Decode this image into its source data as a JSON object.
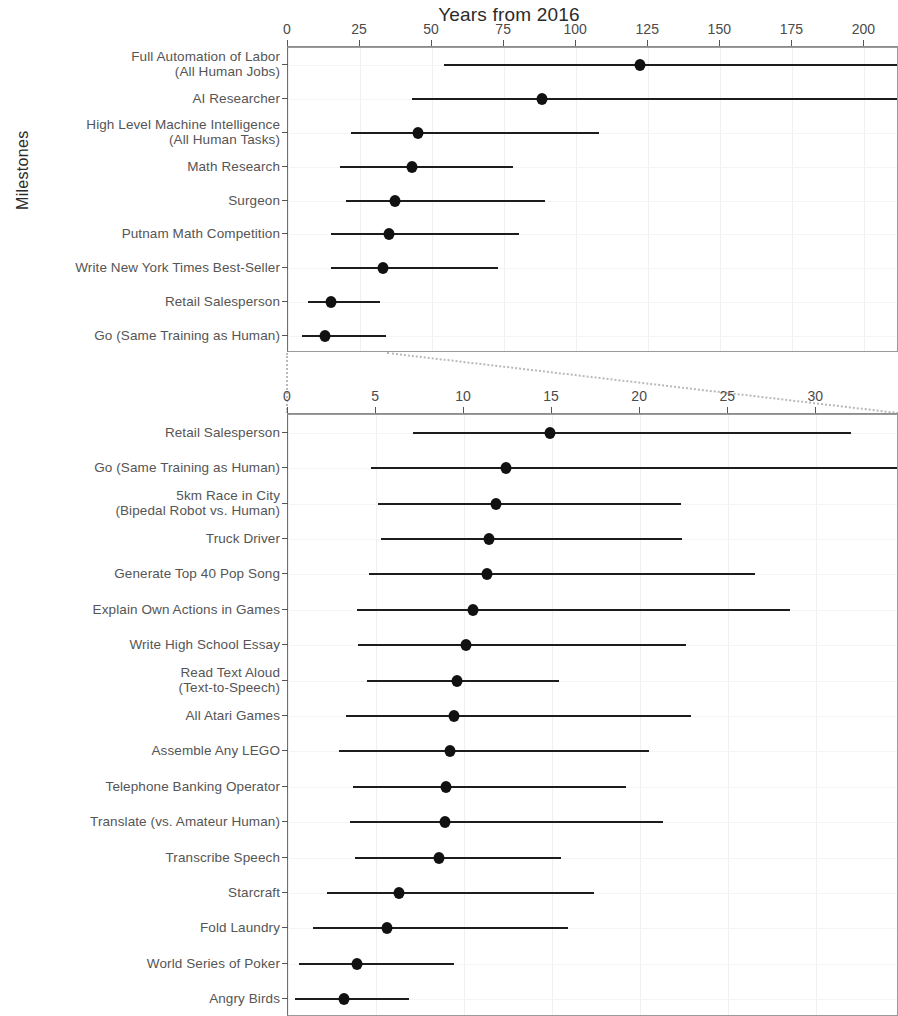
{
  "figure": {
    "x_axis_title": "Years from 2016",
    "y_axis_title": "Milestones"
  },
  "chart_data": [
    {
      "type": "scatter",
      "id": "top-panel",
      "title": "Years from 2016",
      "xlabel": "Years from 2016",
      "ylabel": "Milestones",
      "xlim": [
        0,
        212
      ],
      "grid": true,
      "legend": "none",
      "orientation": "horizontal",
      "marker": "filled-circle-with-range-bar",
      "xticks": [
        0,
        25,
        50,
        75,
        100,
        125,
        150,
        175,
        200
      ],
      "xtick_labels": [
        "0",
        "25",
        "50",
        "75",
        "100",
        "125",
        "150",
        "175",
        "200"
      ],
      "categories": [
        "Full Automation of Labor\n(All Human Jobs)",
        "AI Researcher",
        "High Level Machine Intelligence\n(All Human Tasks)",
        "Math Research",
        "Surgeon",
        "Putnam Math Competition",
        "Write New York Times Best-Seller",
        "Retail Salesperson",
        "Go (Same Training as Human)"
      ],
      "values": [
        122,
        88,
        45,
        43,
        37,
        35,
        33,
        15,
        13
      ],
      "low": [
        54,
        43,
        22,
        18,
        20,
        15,
        15,
        7,
        5
      ],
      "high": [
        212,
        212,
        108,
        78,
        89,
        80,
        73,
        32,
        34
      ],
      "high_clipped": [
        true,
        true,
        false,
        false,
        false,
        false,
        false,
        false,
        false
      ]
    },
    {
      "type": "scatter",
      "id": "bottom-panel",
      "title": "",
      "xlabel": "",
      "ylabel": "Milestones",
      "xlim": [
        0,
        34.7
      ],
      "grid": true,
      "legend": "none",
      "orientation": "horizontal",
      "marker": "filled-circle-with-range-bar",
      "xticks": [
        0,
        5,
        10,
        15,
        20,
        25,
        30
      ],
      "xtick_labels": [
        "0",
        "5",
        "10",
        "15",
        "20",
        "25",
        "30"
      ],
      "categories": [
        "Retail Salesperson",
        "Go (Same Training as Human)",
        "5km Race in City\n(Bipedal Robot vs. Human)",
        "Truck Driver",
        "Generate Top 40 Pop Song",
        "Explain Own Actions in Games",
        "Write High School Essay",
        "Read Text Aloud\n(Text-to-Speech)",
        "All Atari Games",
        "Assemble Any LEGO",
        "Telephone Banking Operator",
        "Translate (vs. Amateur Human)",
        "Transcribe Speech",
        "Starcraft",
        "Fold Laundry",
        "World Series of Poker",
        "Angry Birds"
      ],
      "values": [
        14.9,
        12.4,
        11.8,
        11.4,
        11.3,
        10.5,
        10.1,
        9.6,
        9.4,
        9.2,
        9.0,
        8.9,
        8.6,
        6.3,
        5.6,
        3.9,
        3.2
      ],
      "low": [
        7.1,
        4.7,
        5.1,
        5.3,
        4.6,
        3.9,
        4.0,
        4.5,
        3.3,
        2.9,
        3.7,
        3.5,
        3.8,
        2.2,
        1.4,
        0.6,
        0.4
      ],
      "high": [
        32.0,
        34.7,
        22.3,
        22.4,
        26.5,
        28.5,
        22.6,
        15.4,
        22.9,
        20.5,
        19.2,
        21.3,
        15.5,
        17.4,
        15.9,
        9.4,
        6.9
      ]
    }
  ]
}
